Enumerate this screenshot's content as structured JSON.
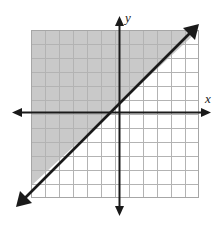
{
  "chart_data": {
    "type": "line",
    "title": "",
    "subtitle": "",
    "xlabel": "x",
    "ylabel": "y",
    "xlim": [
      -6.4,
      5.8
    ],
    "ylim": [
      -6.3,
      5.9
    ],
    "grid": true,
    "grid_step": 1,
    "legend": "none",
    "annotations": [],
    "series": [
      {
        "name": "boundary-line",
        "type": "line",
        "equation": "y = x + 1",
        "slope": 1,
        "intercept": 1,
        "line_style": "solid",
        "x_intercept": -1,
        "y_intercept": 1,
        "arrows": "both",
        "color": "#1a1a1a",
        "x": [
          -6.4,
          5.8
        ],
        "values": [
          -5.4,
          6.8
        ]
      },
      {
        "name": "shaded-region",
        "type": "area",
        "inequality": "y >= x + 1",
        "shaded_side": "above-left",
        "color": "#c9c9c9"
      }
    ]
  },
  "graph": {
    "name": "inequality-graph",
    "x_axis_label": "x",
    "y_axis_label": "y",
    "x_axis_arrows": "both",
    "y_axis_arrows": "both",
    "grid_columns": 12,
    "grid_rows": 12,
    "cell_size_px": 14,
    "origin_px": {
      "x": 119,
      "y": 112
    }
  },
  "colors": {
    "background": "#ffffff",
    "grid_line": "#b3b3b3",
    "grid_border": "#999999",
    "axis": "#1a1a1a",
    "line": "#1a1a1a",
    "shading": "#c9c9c9",
    "label": "#1a1a1a"
  }
}
